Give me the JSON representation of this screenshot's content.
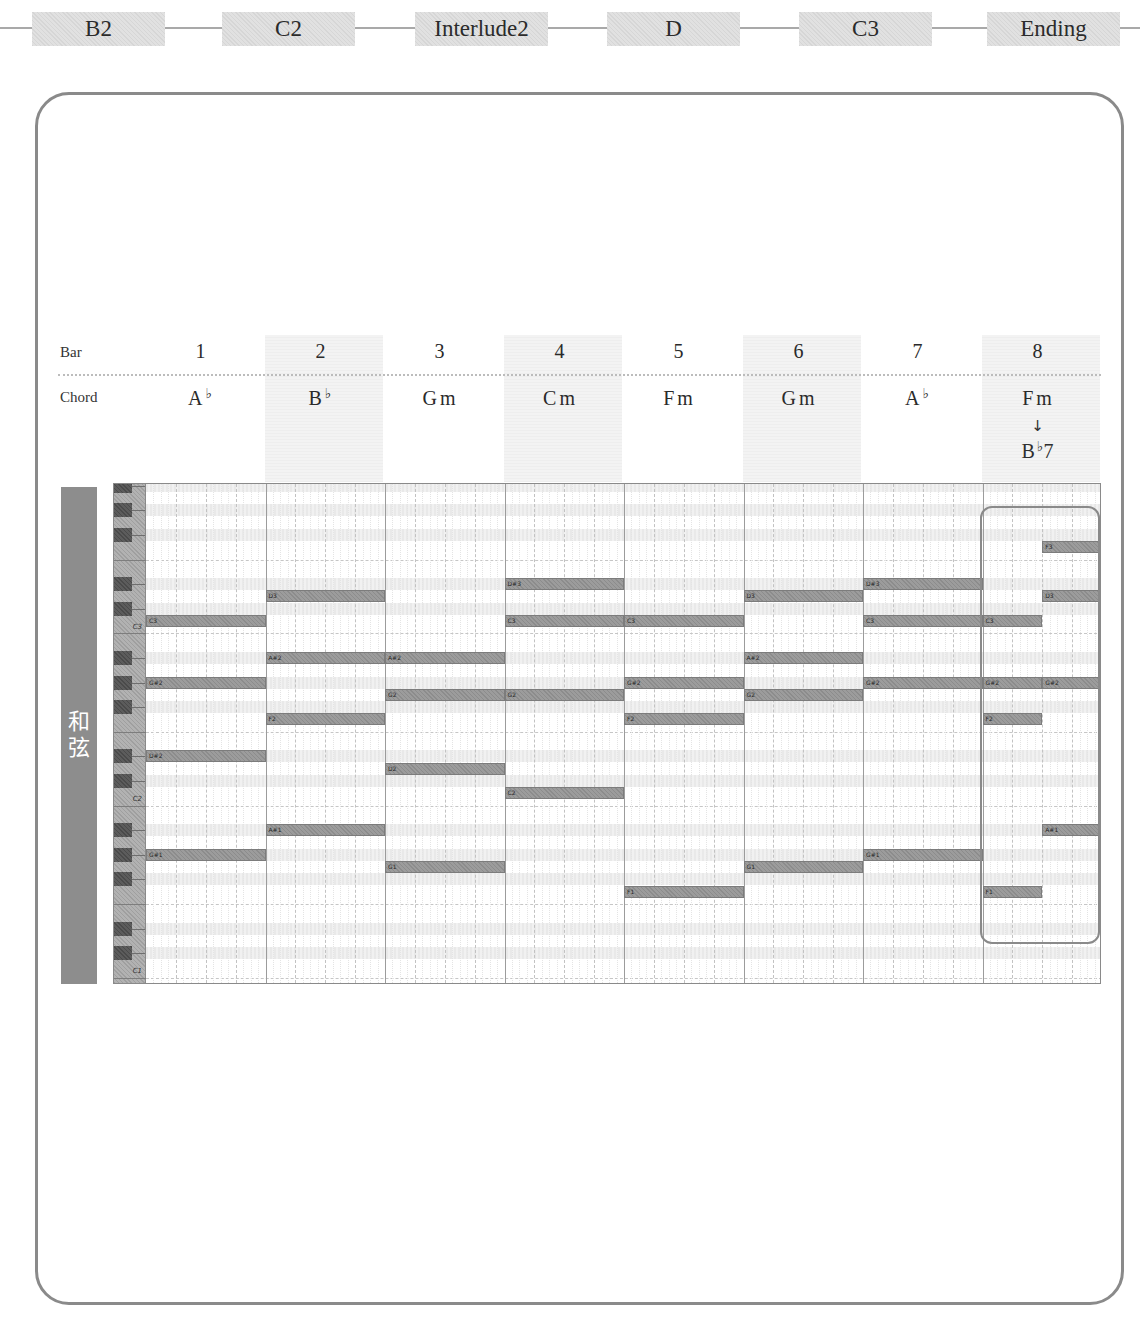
{
  "sections": [
    {
      "label": "B2"
    },
    {
      "label": "C2"
    },
    {
      "label": "Interlude2"
    },
    {
      "label": "D"
    },
    {
      "label": "C3"
    },
    {
      "label": "Ending"
    }
  ],
  "header": {
    "bar_label": "Bar",
    "chord_label": "Chord"
  },
  "bars": [
    {
      "number": "1",
      "chord": {
        "root": "A",
        "accidental": "♭",
        "suffix": ""
      }
    },
    {
      "number": "2",
      "chord": {
        "root": "B",
        "accidental": "♭",
        "suffix": ""
      }
    },
    {
      "number": "3",
      "chord": {
        "root": "G",
        "accidental": "",
        "suffix": "m"
      }
    },
    {
      "number": "4",
      "chord": {
        "root": "C",
        "accidental": "",
        "suffix": "m"
      }
    },
    {
      "number": "5",
      "chord": {
        "root": "F",
        "accidental": "",
        "suffix": "m"
      }
    },
    {
      "number": "6",
      "chord": {
        "root": "G",
        "accidental": "",
        "suffix": "m"
      }
    },
    {
      "number": "7",
      "chord": {
        "root": "A",
        "accidental": "♭",
        "suffix": ""
      }
    },
    {
      "number": "8",
      "chord": {
        "root": "F",
        "accidental": "",
        "suffix": "m"
      },
      "transition_arrow": "↓",
      "next_chord": {
        "root": "B",
        "accidental": "♭",
        "suffix": "7"
      }
    }
  ],
  "side_label": "和弦",
  "piano_roll": {
    "beats_per_bar": 4,
    "octave_labels": [
      {
        "text": "C3",
        "pitch": "C3"
      },
      {
        "text": "C2",
        "pitch": "C2"
      },
      {
        "text": "C1",
        "pitch": "C1"
      }
    ],
    "notes": [
      {
        "bar": 1,
        "start": 0,
        "length": 4,
        "pitch": "C3",
        "label": "C3"
      },
      {
        "bar": 1,
        "start": 0,
        "length": 4,
        "pitch": "G#2",
        "label": "G#2"
      },
      {
        "bar": 1,
        "start": 0,
        "length": 4,
        "pitch": "D#2",
        "label": "D#2"
      },
      {
        "bar": 1,
        "start": 0,
        "length": 4,
        "pitch": "G#1",
        "label": "G#1"
      },
      {
        "bar": 2,
        "start": 0,
        "length": 4,
        "pitch": "D3",
        "label": "D3"
      },
      {
        "bar": 2,
        "start": 0,
        "length": 4,
        "pitch": "A#2",
        "label": "A#2"
      },
      {
        "bar": 2,
        "start": 0,
        "length": 4,
        "pitch": "F2",
        "label": "F2"
      },
      {
        "bar": 2,
        "start": 0,
        "length": 4,
        "pitch": "A#1",
        "label": "A#1"
      },
      {
        "bar": 3,
        "start": 0,
        "length": 4,
        "pitch": "A#2",
        "label": "A#2"
      },
      {
        "bar": 3,
        "start": 0,
        "length": 4,
        "pitch": "G2",
        "label": "G2"
      },
      {
        "bar": 3,
        "start": 0,
        "length": 4,
        "pitch": "D2",
        "label": "D2"
      },
      {
        "bar": 3,
        "start": 0,
        "length": 4,
        "pitch": "G1",
        "label": "G1"
      },
      {
        "bar": 4,
        "start": 0,
        "length": 4,
        "pitch": "D#3",
        "label": "D#3"
      },
      {
        "bar": 4,
        "start": 0,
        "length": 4,
        "pitch": "C3",
        "label": "C3"
      },
      {
        "bar": 4,
        "start": 0,
        "length": 4,
        "pitch": "G2",
        "label": "G2"
      },
      {
        "bar": 4,
        "start": 0,
        "length": 4,
        "pitch": "C2",
        "label": "C2"
      },
      {
        "bar": 5,
        "start": 0,
        "length": 4,
        "pitch": "C3",
        "label": "C3"
      },
      {
        "bar": 5,
        "start": 0,
        "length": 4,
        "pitch": "G#2",
        "label": "G#2"
      },
      {
        "bar": 5,
        "start": 0,
        "length": 4,
        "pitch": "F2",
        "label": "F2"
      },
      {
        "bar": 5,
        "start": 0,
        "length": 4,
        "pitch": "F1",
        "label": "F1"
      },
      {
        "bar": 6,
        "start": 0,
        "length": 4,
        "pitch": "D3",
        "label": "D3"
      },
      {
        "bar": 6,
        "start": 0,
        "length": 4,
        "pitch": "A#2",
        "label": "A#2"
      },
      {
        "bar": 6,
        "start": 0,
        "length": 4,
        "pitch": "G2",
        "label": "G2"
      },
      {
        "bar": 6,
        "start": 0,
        "length": 4,
        "pitch": "G1",
        "label": "G1"
      },
      {
        "bar": 7,
        "start": 0,
        "length": 4,
        "pitch": "D#3",
        "label": "D#3"
      },
      {
        "bar": 7,
        "start": 0,
        "length": 4,
        "pitch": "C3",
        "label": "C3"
      },
      {
        "bar": 7,
        "start": 0,
        "length": 4,
        "pitch": "G#2",
        "label": "G#2"
      },
      {
        "bar": 7,
        "start": 0,
        "length": 4,
        "pitch": "G#1",
        "label": "G#1"
      },
      {
        "bar": 8,
        "start": 0,
        "length": 2,
        "pitch": "C3",
        "label": "C3"
      },
      {
        "bar": 8,
        "start": 0,
        "length": 2,
        "pitch": "G#2",
        "label": "G#2"
      },
      {
        "bar": 8,
        "start": 0,
        "length": 2,
        "pitch": "F2",
        "label": "F2"
      },
      {
        "bar": 8,
        "start": 0,
        "length": 2,
        "pitch": "F1",
        "label": "F1"
      },
      {
        "bar": 8,
        "start": 2,
        "length": 2,
        "pitch": "F3",
        "label": "F3"
      },
      {
        "bar": 8,
        "start": 2,
        "length": 2,
        "pitch": "D3",
        "label": "D3"
      },
      {
        "bar": 8,
        "start": 2,
        "length": 2,
        "pitch": "G#2",
        "label": "G#2"
      },
      {
        "bar": 8,
        "start": 2,
        "length": 2,
        "pitch": "A#1",
        "label": "A#1"
      }
    ],
    "highlight": {
      "bar": 8
    }
  },
  "colors": {
    "note": "#8c8c8c",
    "section_bg": "#dcdcdc",
    "frame": "#8a8a8a",
    "side_label_bg": "#8d8d8d",
    "header_shade": "#f0f0f0"
  }
}
